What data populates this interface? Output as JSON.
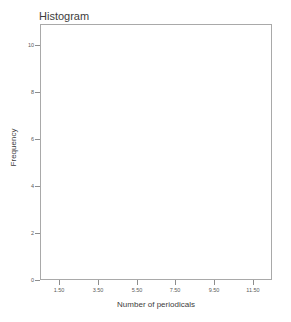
{
  "chart_data": {
    "type": "bar",
    "title": "Histogram",
    "xlabel": "Number of periodicals",
    "ylabel": "Frequency",
    "x_tick_labels": [
      "1.50",
      "3.50",
      "5.50",
      "7.50",
      "9.50",
      "11.50"
    ],
    "x_tick_values": [
      1.5,
      3.5,
      5.5,
      7.5,
      9.5,
      11.5
    ],
    "y_tick_labels": [
      "0",
      "2",
      "4",
      "6",
      "8",
      "10"
    ],
    "y_tick_values": [
      0,
      2,
      4,
      6,
      8,
      10
    ],
    "xlim": [
      0.5,
      12.5
    ],
    "ylim": [
      0,
      10.9
    ],
    "grid": false,
    "legend": null,
    "categories": [],
    "values": [],
    "note": "Plot area is empty - no bars are rendered in this histogram"
  },
  "figure": {
    "title": "Histogram",
    "x_axis": {
      "title": "Number of periodicals",
      "ticks": [
        {
          "label": "1.50",
          "value": 1.5
        },
        {
          "label": "3.50",
          "value": 3.5
        },
        {
          "label": "5.50",
          "value": 5.5
        },
        {
          "label": "7.50",
          "value": 7.5
        },
        {
          "label": "9.50",
          "value": 9.5
        },
        {
          "label": "11.50",
          "value": 11.5
        }
      ]
    },
    "y_axis": {
      "title": "Frequency",
      "ticks": [
        {
          "label": "10",
          "value": 10
        },
        {
          "label": "8",
          "value": 8
        },
        {
          "label": "6",
          "value": 6
        },
        {
          "label": "4",
          "value": 4
        },
        {
          "label": "2",
          "value": 2
        },
        {
          "label": "0",
          "value": 0
        }
      ]
    },
    "artifact_text": "",
    "colors": {
      "frame": "#a9a9a9",
      "tick": "#8d8d8d",
      "text": "#4a4a4a",
      "background": "#ffffff",
      "bar": "#7f7f7f"
    }
  }
}
